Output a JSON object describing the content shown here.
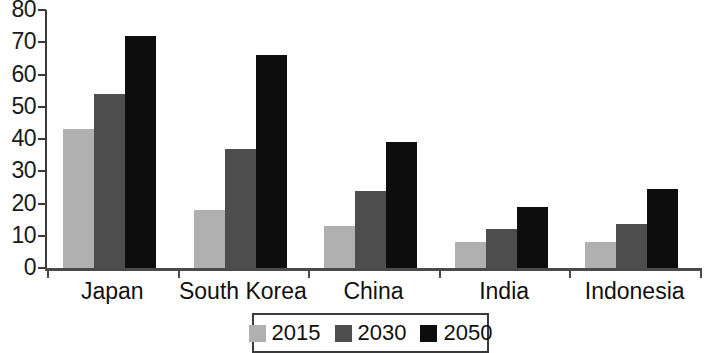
{
  "chart_data": {
    "type": "bar",
    "title": "",
    "subtitle": "",
    "xlabel": "",
    "ylabel": "",
    "ylim": [
      0,
      80
    ],
    "ytick_step": 10,
    "ytick_labels": [
      "80",
      "70",
      "60",
      "50",
      "40",
      "30",
      "20",
      "10",
      "0"
    ],
    "grid": false,
    "legend_position": "bottom-center",
    "categories": [
      "Japan",
      "South Korea",
      "China",
      "India",
      "Indonesia"
    ],
    "series": [
      {
        "name": "2015",
        "color": "#b0b0b0",
        "values": [
          43,
          18,
          13,
          8,
          8
        ]
      },
      {
        "name": "2030",
        "color": "#4d4d4d",
        "values": [
          54,
          37,
          24,
          12,
          13.5
        ]
      },
      {
        "name": "2050",
        "color": "#0d0d0d",
        "values": [
          72,
          66,
          39,
          19,
          24.5
        ]
      }
    ]
  },
  "legend": {
    "items": [
      {
        "label": "2015",
        "color": "#b0b0b0"
      },
      {
        "label": "2030",
        "color": "#4d4d4d"
      },
      {
        "label": "2050",
        "color": "#0d0d0d"
      }
    ]
  },
  "colors": {
    "axis": "#4a4a4a",
    "text": "#111111",
    "background": "#ffffff",
    "series_2015": "#b0b0b0",
    "series_2030": "#4d4d4d",
    "series_2050": "#0d0d0d"
  }
}
